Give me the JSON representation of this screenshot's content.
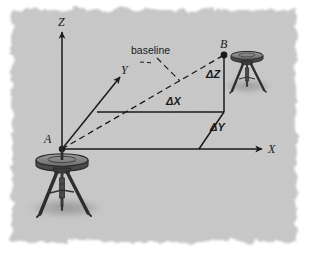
{
  "figure": {
    "kind": "survey-baseline-diagram",
    "background_color": "#ffffff",
    "panel_color": "#c8c8c8",
    "ink_color": "#1a1a1a",
    "labels": {
      "axis_z": "Z",
      "axis_y": "Y",
      "axis_x": "X",
      "point_a": "A",
      "point_b": "B",
      "baseline": "baseline",
      "delta_x": "ΔX",
      "delta_y": "ΔY",
      "delta_z": "ΔZ"
    },
    "elements": {
      "station_a": "gps-antenna-tripod",
      "station_b": "gps-antenna-tripod",
      "baseline_style": "dashed",
      "component_style": "solid"
    }
  }
}
